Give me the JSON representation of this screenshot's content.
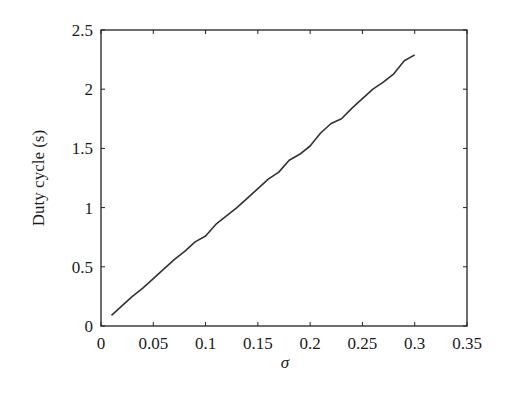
{
  "chart_data": {
    "type": "line",
    "title": "",
    "xlabel": "σ",
    "ylabel": "Duty cycle (s)",
    "xlim": [
      0,
      0.35
    ],
    "ylim": [
      0,
      2.5
    ],
    "xticks": [
      "0",
      "0.05",
      "0.1",
      "0.15",
      "0.2",
      "0.25",
      "0.3",
      "0.35"
    ],
    "yticks": [
      "0",
      "0.5",
      "1",
      "1.5",
      "2",
      "2.5"
    ],
    "grid": false,
    "legend": null,
    "series": [
      {
        "name": "Duty cycle",
        "color": "#333333",
        "x": [
          0.01,
          0.02,
          0.03,
          0.04,
          0.05,
          0.06,
          0.07,
          0.08,
          0.09,
          0.1,
          0.11,
          0.12,
          0.13,
          0.14,
          0.15,
          0.16,
          0.17,
          0.18,
          0.19,
          0.2,
          0.21,
          0.22,
          0.23,
          0.24,
          0.25,
          0.26,
          0.27,
          0.28,
          0.29,
          0.3
        ],
        "y": [
          0.09,
          0.17,
          0.25,
          0.32,
          0.4,
          0.48,
          0.56,
          0.63,
          0.71,
          0.76,
          0.86,
          0.93,
          1.0,
          1.08,
          1.16,
          1.24,
          1.3,
          1.4,
          1.45,
          1.52,
          1.63,
          1.71,
          1.75,
          1.84,
          1.92,
          2.0,
          2.06,
          2.13,
          2.24,
          2.29
        ]
      }
    ]
  }
}
